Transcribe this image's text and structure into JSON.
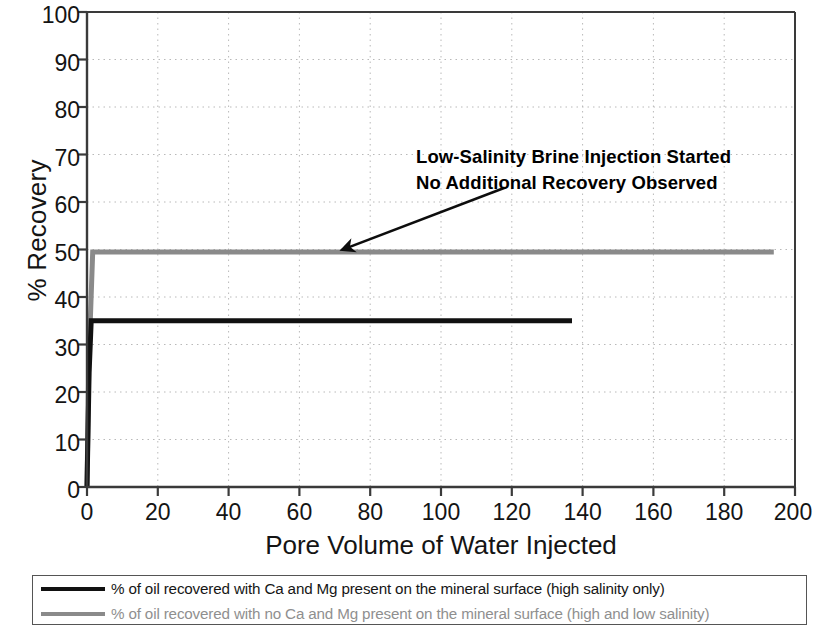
{
  "chart_data": {
    "type": "line",
    "title": "",
    "xlabel": "Pore Volume of Water Injected",
    "ylabel": "% Recovery",
    "xlim": [
      0,
      200
    ],
    "ylim": [
      0,
      100
    ],
    "xticks": [
      0,
      20,
      40,
      60,
      80,
      100,
      120,
      140,
      160,
      180,
      200
    ],
    "yticks": [
      0,
      10,
      20,
      30,
      40,
      50,
      60,
      70,
      80,
      90,
      100
    ],
    "grid": "dotted-both-axes",
    "legend_position": "below-plot",
    "series": [
      {
        "name": "% of oil recovered with Ca and Mg present on the mineral surface (high salinity only)",
        "color": "#111111",
        "x": [
          0.0,
          0.6,
          1.2,
          137.0
        ],
        "y": [
          0.0,
          24.0,
          35.0,
          35.0
        ],
        "plateau_value": 35,
        "x_end": 137
      },
      {
        "name": "% of oil recovered with no Ca and Mg present on the mineral surface (high and low salinity)",
        "color": "#8a8a8a",
        "x": [
          0.0,
          0.5,
          1.6,
          194.0
        ],
        "y": [
          0.0,
          26.0,
          49.5,
          49.5
        ],
        "plateau_value": 49.5,
        "x_end": 194
      }
    ],
    "annotations": [
      {
        "text_line_1": "Low-Salinity Brine Injection Started",
        "text_line_2": "No Additional Recovery Observed",
        "arrow_from": [
          118,
          63
        ],
        "arrow_to": [
          72,
          49.5
        ]
      }
    ]
  },
  "axes": {
    "y_title": "% Recovery",
    "x_title": "Pore Volume of Water Injected",
    "y_tick_labels": [
      "100",
      "90",
      "80",
      "70",
      "60",
      "50",
      "40",
      "30",
      "20",
      "10",
      "0"
    ],
    "x_tick_labels": [
      "0",
      "20",
      "40",
      "60",
      "80",
      "100",
      "120",
      "140",
      "160",
      "180",
      "200"
    ]
  },
  "annotation": {
    "line1": "Low-Salinity Brine Injection Started",
    "line2": "No Additional Recovery Observed"
  },
  "legend": {
    "items": [
      {
        "label": "% of oil recovered with Ca and Mg present on the mineral surface (high salinity only)",
        "color": "#111111"
      },
      {
        "label": "% of oil recovered with no Ca and Mg present on the mineral surface (high and low salinity)",
        "color": "#8a8a8a"
      }
    ]
  },
  "colors": {
    "series_black": "#111111",
    "series_gray": "#8a8a8a",
    "grid": "#b9b9b9",
    "axis": "#3a3a3a",
    "text": "#141414"
  }
}
